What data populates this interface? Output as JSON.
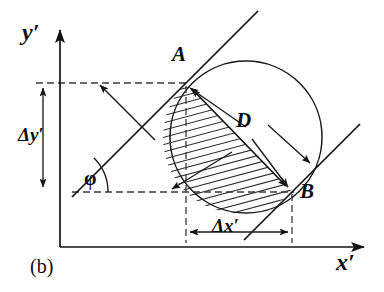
{
  "figure": {
    "caption": "(b)",
    "background_color": "#ffffff",
    "ink_color": "#1a1a1a",
    "width": 384,
    "height": 292
  },
  "axes": {
    "y_axis": {
      "label": "y′",
      "label_x": 24,
      "label_y": 30,
      "x": 60,
      "y_top": 22,
      "y_bottom": 247,
      "arrow": "up"
    },
    "x_axis": {
      "label": "x′",
      "label_x": 340,
      "label_y": 252,
      "y": 247,
      "x_left": 60,
      "x_right": 372,
      "arrow": "right"
    }
  },
  "points": [
    {
      "name": "A",
      "label": "A",
      "x": 186,
      "y": 83,
      "label_x": 172,
      "label_y": 52
    },
    {
      "name": "B",
      "label": "B",
      "x": 292,
      "y": 192,
      "label_x": 300,
      "label_y": 188
    }
  ],
  "circle": {
    "cx": 246,
    "cy": 137,
    "r": 76,
    "label": ""
  },
  "chord": {
    "label": "D",
    "label_x": 240,
    "label_y": 118,
    "from": "A",
    "to": "B",
    "arrow": "double"
  },
  "delta_y": {
    "label": "Δy′",
    "label_x": 22,
    "label_y": 128,
    "arrow_x": 43,
    "y_top": 83,
    "y_bottom": 192,
    "arrow": "double"
  },
  "delta_x": {
    "label": "Δx′",
    "label_x": 216,
    "label_y": 222,
    "arrow_y": 232,
    "x_left": 186,
    "x_right": 292,
    "arrow": "double"
  },
  "angle": {
    "label": "φ",
    "label_x": 86,
    "label_y": 178,
    "vertex_x": 60,
    "vertex_y": 192,
    "arc_radius": 48,
    "degrees": 45
  },
  "tangent_lines": [
    {
      "name": "tangent-through-A",
      "x1": 72,
      "y1": 197,
      "x2": 258,
      "y2": 11
    },
    {
      "name": "tangent-through-B",
      "x1": 244,
      "y1": 240,
      "x2": 360,
      "y2": 124
    }
  ],
  "dashed_guides": [
    {
      "name": "horizontal-guide-A",
      "x1": 36,
      "y1": 83,
      "x2": 190,
      "y2": 83
    },
    {
      "name": "horizontal-guide-B",
      "x1": 72,
      "y1": 192,
      "x2": 294,
      "y2": 192
    },
    {
      "name": "vertical-guide-A",
      "x1": 186,
      "y1": 86,
      "x2": 186,
      "y2": 243
    },
    {
      "name": "vertical-guide-B",
      "x1": 292,
      "y1": 194,
      "x2": 292,
      "y2": 243
    }
  ],
  "pointer_arrows": [
    {
      "name": "pointer-to-A-from-upper-left",
      "x1": 155,
      "y1": 140,
      "x2": 98,
      "y2": 83
    },
    {
      "name": "pointer-to-A-inner",
      "x1": 210,
      "y1": 118,
      "x2": 190,
      "y2": 88
    },
    {
      "name": "pointer-to-B-inner",
      "x1": 270,
      "y1": 160,
      "x2": 290,
      "y2": 188
    },
    {
      "name": "pointer-to-lower-left-edge",
      "x1": 225,
      "y1": 155,
      "x2": 170,
      "y2": 190
    }
  ],
  "hatching": {
    "name": "hatched-lens-region",
    "description": "diagonal hatch fill of circular segment between chord AB and circle arc",
    "angle_degrees": 75,
    "spacing": 7
  }
}
